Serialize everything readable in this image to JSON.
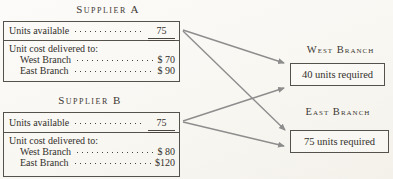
{
  "diagram": {
    "suppliers": [
      {
        "id": "supplier-a",
        "title": "Supplier A",
        "units_label": "Units available",
        "units_value": "75",
        "cost_header": "Unit cost delivered to:",
        "cost_rows": [
          {
            "label": "West Branch",
            "value": "$ 70"
          },
          {
            "label": "East Branch",
            "value": "$ 90"
          }
        ]
      },
      {
        "id": "supplier-b",
        "title": "Supplier B",
        "units_label": "Units available",
        "units_value": "75",
        "cost_header": "Unit cost delivered to:",
        "cost_rows": [
          {
            "label": "West Branch",
            "value": "$ 80"
          },
          {
            "label": "East Branch",
            "value": "$120"
          }
        ]
      }
    ],
    "branches": [
      {
        "id": "west-branch",
        "title": "West Branch",
        "requirement": "40 units required"
      },
      {
        "id": "east-branch",
        "title": "East Branch",
        "requirement": "75 units required"
      }
    ],
    "connections": [
      {
        "from": "supplier-a",
        "to": "west-branch",
        "x1": 183,
        "y1": 30,
        "x2": 284,
        "y2": 63
      },
      {
        "from": "supplier-a",
        "to": "east-branch",
        "x1": 183,
        "y1": 31,
        "x2": 285,
        "y2": 130
      },
      {
        "from": "supplier-b",
        "to": "west-branch",
        "x1": 183,
        "y1": 121,
        "x2": 284,
        "y2": 88
      },
      {
        "from": "supplier-b",
        "to": "east-branch",
        "x1": 183,
        "y1": 122,
        "x2": 284,
        "y2": 146
      }
    ],
    "colors": {
      "background": "#f9f7f2",
      "box_border": "#55514b",
      "text": "#33302b",
      "arrow": "#8d8d8d"
    }
  }
}
